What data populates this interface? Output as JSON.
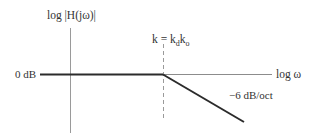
{
  "diagram": {
    "type": "bode-magnitude-asymptote",
    "y_axis_label": "log |H(jω)|",
    "x_axis_label": "log ω",
    "level_label": "0 dB",
    "corner_label": {
      "k": "k = k",
      "sub_d": "d",
      "k2": "k",
      "sub_o": "o"
    },
    "slope_label": "−6 dB/oct",
    "colors": {
      "axis": "#8c8c8c",
      "response": "#2b2b2b",
      "dashed": "#9a9a9a",
      "text": "#333333"
    }
  }
}
